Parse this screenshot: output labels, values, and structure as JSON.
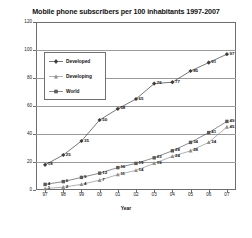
{
  "chart_data": {
    "type": "line",
    "title": "Mobile phone subscribers per 100 inhabitants 1997-2007",
    "xlabel": "Year",
    "ylabel": "",
    "categories": [
      "97",
      "98",
      "99",
      "00",
      "01",
      "02",
      "03",
      "04",
      "05",
      "06",
      "07"
    ],
    "ylim": [
      0,
      120
    ],
    "yticks": [
      "0",
      "20",
      "40",
      "60",
      "80",
      "100",
      "120"
    ],
    "grid": true,
    "legend_position": "upper-left-inside",
    "series": [
      {
        "name": "Developed",
        "marker": "diamond",
        "color": "#3c3c3c",
        "values": [
          18,
          25,
          35,
          50,
          58,
          65,
          76,
          77,
          85,
          91,
          97
        ],
        "labels": [
          "18",
          "25",
          "35",
          "50",
          "58",
          "65",
          "76",
          "77",
          "85",
          "91",
          "97"
        ]
      },
      {
        "name": "Developing",
        "marker": "triangle",
        "color": "#8f8f8f",
        "values": [
          1,
          2,
          4,
          7,
          11,
          14,
          19,
          24,
          28,
          34,
          45
        ],
        "labels": [
          "1",
          "2",
          "4",
          "7",
          "11",
          "14",
          "19",
          "24",
          "28",
          "34",
          "45"
        ]
      },
      {
        "name": "World",
        "marker": "square",
        "color": "#5a5a5a",
        "values": [
          4,
          6,
          9,
          12,
          16,
          19,
          23,
          28,
          34,
          41,
          49
        ],
        "labels": [
          "4",
          "6",
          "9",
          "12",
          "16",
          "19",
          "23",
          "28",
          "34",
          "41",
          "49"
        ]
      }
    ]
  }
}
